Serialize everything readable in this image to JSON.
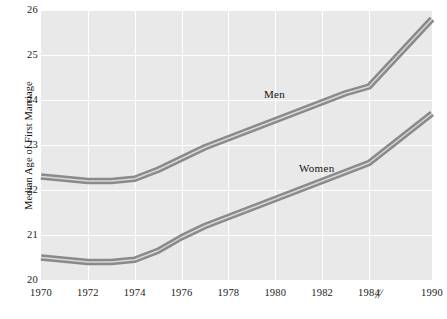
{
  "chart_data": {
    "type": "line",
    "title": "",
    "xlabel": "",
    "ylabel": "Median Age of First Marriage",
    "xlim": [
      1970,
      1990
    ],
    "ylim": [
      20,
      26
    ],
    "grid": true,
    "legend": "inline-labels",
    "axis_break": {
      "symbol": "//",
      "between": [
        1984,
        1990
      ]
    },
    "x_ticks": [
      "1970",
      "1972",
      "1974",
      "1976",
      "1978",
      "1980",
      "1982",
      "1984",
      "1990"
    ],
    "y_ticks": [
      "20",
      "21",
      "22",
      "23",
      "24",
      "25",
      "26"
    ],
    "x": [
      1970,
      1971,
      1972,
      1973,
      1974,
      1975,
      1976,
      1977,
      1978,
      1979,
      1980,
      1981,
      1982,
      1983,
      1984,
      1990
    ],
    "series": [
      {
        "name": "Men",
        "color": "#8a8a8a",
        "values": [
          22.3,
          22.25,
          22.2,
          22.2,
          22.25,
          22.45,
          22.7,
          22.95,
          23.15,
          23.35,
          23.55,
          23.75,
          23.95,
          24.15,
          24.3,
          25.8
        ]
      },
      {
        "name": "Women",
        "color": "#8a8a8a",
        "values": [
          20.5,
          20.45,
          20.4,
          20.4,
          20.45,
          20.65,
          20.95,
          21.2,
          21.4,
          21.6,
          21.8,
          22.0,
          22.2,
          22.4,
          22.6,
          23.7
        ]
      }
    ]
  },
  "axis": {
    "y_label": "Median Age of First Marriage",
    "y_ticks": [
      {
        "value": 26,
        "label": "26"
      },
      {
        "value": 25,
        "label": "25"
      },
      {
        "value": 24,
        "label": "24"
      },
      {
        "value": 23,
        "label": "23"
      },
      {
        "value": 22,
        "label": "22"
      },
      {
        "value": 21,
        "label": "21"
      },
      {
        "value": 20,
        "label": "20"
      }
    ],
    "x_ticks": [
      {
        "value": 1970,
        "label": "1970"
      },
      {
        "value": 1972,
        "label": "1972"
      },
      {
        "value": 1974,
        "label": "1974"
      },
      {
        "value": 1976,
        "label": "1976"
      },
      {
        "value": 1978,
        "label": "1978"
      },
      {
        "value": 1980,
        "label": "1980"
      },
      {
        "value": 1982,
        "label": "1982"
      },
      {
        "value": 1984,
        "label": "1984"
      },
      {
        "value": 1990,
        "label": "1990"
      }
    ],
    "break_symbol": "//"
  },
  "labels": {
    "men": "Men",
    "women": "Women"
  },
  "colors": {
    "plot_background": "#e9e9e9",
    "gridline": "#ffffff",
    "band_dark": "#8a8a8a",
    "band_light": "#d8d8d8",
    "text": "#1a1a1a",
    "page_background": "#ffffff"
  }
}
